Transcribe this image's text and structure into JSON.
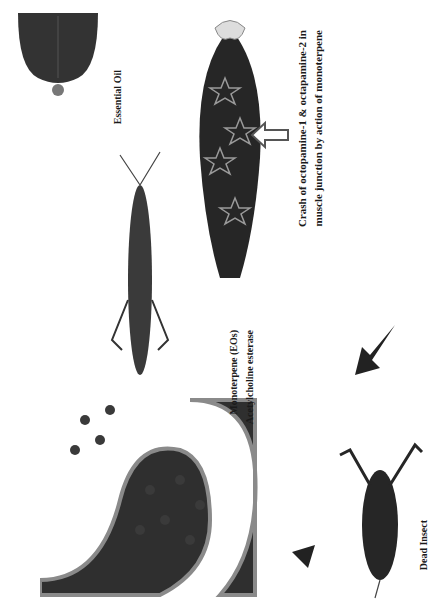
{
  "figure": {
    "type": "mechanism-diagram",
    "orientation": "rotated-90",
    "background": "#ffffff",
    "ink": "#1a1a1a",
    "stages": [
      {
        "id": "essential-oil",
        "label": "Essential Oil",
        "icon": "leaf-with-droplet"
      },
      {
        "id": "live-insect",
        "label": "",
        "icon": "grasshopper-alive"
      },
      {
        "id": "synapse",
        "labels": {
          "monoterpene": "Monoterpene (EOs)",
          "acetylcholine": "Acetylcholine esterase"
        },
        "icon": "synaptic-junction"
      },
      {
        "id": "leg-muscle",
        "caption_line1": "Crash of octopamine-1 & octapamine-2 in",
        "caption_line2": "muscle junction by action of monoterpene",
        "icon": "insect-leg-muscle-with-receptor-stars"
      },
      {
        "id": "dead-insect",
        "label": "Dead Insect",
        "icon": "grasshopper-dead"
      }
    ],
    "arrows": [
      {
        "id": "arrow-synapse-to-dead",
        "style": "thick-gradient"
      },
      {
        "id": "arrow-dead-to-leg",
        "style": "thick-gradient"
      },
      {
        "id": "arrow-caption-to-leg",
        "style": "outlined-block"
      }
    ]
  }
}
